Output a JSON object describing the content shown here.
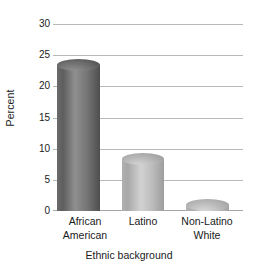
{
  "chart_data": {
    "type": "bar",
    "title": "",
    "subtitle": "",
    "xlabel": "Ethnic background",
    "ylabel": "Percent",
    "categories": [
      "African American",
      "Latino",
      "Non-Latino White"
    ],
    "category_lines": [
      [
        "African",
        "American"
      ],
      [
        "Latino",
        ""
      ],
      [
        "Non-Latino",
        "White"
      ]
    ],
    "values": [
      24.5,
      9.3,
      2.0
    ],
    "series": [
      {
        "name": "Percent",
        "values": [
          24.5,
          9.3,
          2.0
        ]
      }
    ],
    "ylim": [
      0,
      30
    ],
    "yticks": [
      0,
      5,
      10,
      15,
      20,
      25,
      30
    ],
    "ytick_labels": [
      "0",
      "5",
      "10",
      "15",
      "20",
      "25",
      "30"
    ],
    "grid": true,
    "grid_axis": "y",
    "legend": false,
    "legend_position": "none",
    "annotations": [],
    "bar_style": "3d-cylinder",
    "bar_colors": [
      "#6e6e6e",
      "#b4b4b4",
      "#b9b9b9"
    ]
  },
  "colors": {
    "background": "#ffffff",
    "gridline": "#b9b9b9",
    "baseline": "#a6a6a6",
    "text": "#1a1a1a",
    "bar_1_dark": "#5a5a5a",
    "bar_1_light": "#8a8a8a",
    "bar_2_dark": "#a3a3a3",
    "bar_2_light": "#cacaca",
    "bar_3_dark": "#a8a8a8",
    "bar_3_light": "#d0d0d0"
  }
}
